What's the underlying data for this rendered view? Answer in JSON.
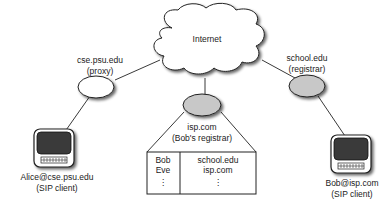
{
  "diagram": {
    "internet": {
      "label": "Internet"
    },
    "proxy": {
      "name": "cse.psu.edu",
      "role": "(proxy)",
      "fill": "#ffffff"
    },
    "school_registrar": {
      "name": "school.edu",
      "role": "(registrar)",
      "fill": "#c8c8c8"
    },
    "isp_registrar": {
      "name": "isp.com",
      "role": "(Bob's registrar)",
      "fill": "#c8c8c8"
    },
    "registrar_table": {
      "users": [
        "Bob",
        "Eve",
        "⋮"
      ],
      "domains": [
        "school.edu",
        "isp.com",
        "⋮"
      ]
    },
    "alice": {
      "name": "Alice@cse.psu.edu",
      "role": "(SIP client)",
      "icon": "computer-icon"
    },
    "bob": {
      "name": "Bob@isp.com",
      "role": "(SIP client)",
      "icon": "computer-icon"
    }
  }
}
